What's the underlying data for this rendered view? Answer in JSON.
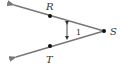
{
  "diagram": {
    "type": "angle",
    "vertex": {
      "label": "S",
      "x": 104,
      "y": 31
    },
    "points": [
      {
        "label": "R",
        "x": 50,
        "y": 16
      },
      {
        "label": "T",
        "x": 50,
        "y": 46
      }
    ],
    "rays": [
      {
        "from": "S",
        "through": "R",
        "end": {
          "x": 12,
          "y": 4
        }
      },
      {
        "from": "S",
        "through": "T",
        "end": {
          "x": 14,
          "y": 58
        }
      }
    ],
    "angle_marker": {
      "label": "1"
    },
    "colors": {
      "ray": "#777777",
      "point": "#111111",
      "text": "#333333"
    }
  }
}
